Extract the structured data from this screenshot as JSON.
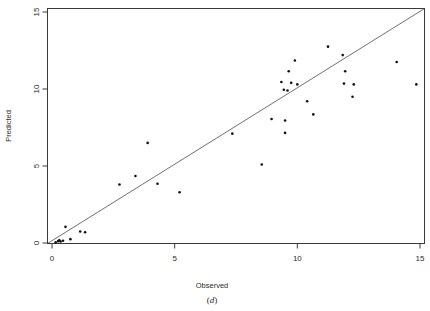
{
  "figure": {
    "caption": "(d)",
    "caption_prefix": "(",
    "caption_letter": "d",
    "caption_suffix": ")"
  },
  "chart_data": {
    "type": "scatter",
    "title": "",
    "xlabel": "Observed",
    "ylabel": "Predicted",
    "xlim": [
      -0.6,
      15.6
    ],
    "ylim": [
      -0.7,
      15.6
    ],
    "xticks": [
      0,
      5,
      10,
      15
    ],
    "yticks": [
      0,
      5,
      10,
      15
    ],
    "xtick_labels": [
      "0",
      "5",
      "10",
      "15"
    ],
    "ytick_labels": [
      "0",
      "5",
      "10",
      "15"
    ],
    "grid": false,
    "legend": null,
    "reference_line": {
      "type": "identity",
      "label": "y = x",
      "from": [
        -0.45,
        -0.45
      ],
      "to": [
        15.55,
        15.55
      ],
      "dashed": false
    },
    "series": [
      {
        "name": "Observed vs Predicted",
        "marker": "point",
        "color": "#111111",
        "points": [
          [
            0.15,
            0.05
          ],
          [
            0.25,
            0.12
          ],
          [
            0.3,
            0.18
          ],
          [
            0.35,
            0.1
          ],
          [
            0.45,
            0.15
          ],
          [
            0.55,
            1.05
          ],
          [
            0.75,
            0.25
          ],
          [
            1.15,
            0.75
          ],
          [
            1.35,
            0.7
          ],
          [
            2.75,
            3.8
          ],
          [
            3.4,
            4.35
          ],
          [
            3.9,
            6.5
          ],
          [
            4.3,
            3.85
          ],
          [
            5.2,
            3.3
          ],
          [
            7.35,
            7.1
          ],
          [
            8.55,
            5.1
          ],
          [
            8.95,
            8.05
          ],
          [
            9.35,
            10.45
          ],
          [
            9.45,
            9.95
          ],
          [
            9.5,
            7.95
          ],
          [
            9.5,
            7.15
          ],
          [
            9.6,
            9.9
          ],
          [
            9.65,
            11.15
          ],
          [
            9.75,
            10.4
          ],
          [
            9.9,
            11.85
          ],
          [
            10.0,
            10.3
          ],
          [
            10.4,
            9.2
          ],
          [
            10.65,
            8.35
          ],
          [
            11.25,
            12.75
          ],
          [
            11.85,
            12.2
          ],
          [
            11.9,
            10.35
          ],
          [
            11.95,
            11.15
          ],
          [
            12.25,
            9.5
          ],
          [
            12.3,
            10.3
          ],
          [
            14.05,
            11.75
          ],
          [
            14.85,
            10.3
          ]
        ]
      }
    ]
  }
}
